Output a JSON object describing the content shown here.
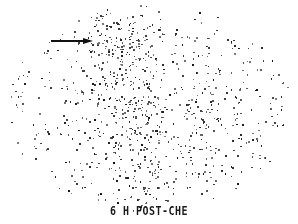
{
  "image": {
    "type": "scintigraphy-scan",
    "caption": "6 H POST-CHE",
    "colors": {
      "background": "#ffffff",
      "counts": "#111111"
    }
  },
  "annotation": {
    "arrow": {
      "direction": "right",
      "from": [
        51,
        40
      ],
      "to": [
        93,
        40
      ],
      "color": "#111111"
    }
  },
  "field": {
    "cx": 149,
    "cy": 108,
    "rx": 142,
    "ry": 98
  },
  "hotspots": [
    {
      "name": "upper-left-uptake",
      "x": 120,
      "y": 60,
      "rx": 28,
      "ry": 45,
      "weight": 1.0
    },
    {
      "name": "central-column",
      "x": 135,
      "y": 140,
      "rx": 24,
      "ry": 45,
      "weight": 0.8
    },
    {
      "name": "lower-midline",
      "x": 150,
      "y": 190,
      "rx": 16,
      "ry": 15,
      "weight": 1.0
    },
    {
      "name": "right-lobe",
      "x": 200,
      "y": 125,
      "rx": 28,
      "ry": 35,
      "weight": 0.5
    }
  ]
}
